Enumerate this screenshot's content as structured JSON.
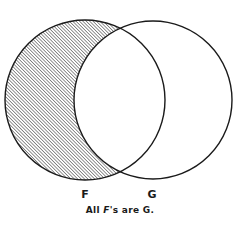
{
  "diagram": {
    "type": "venn",
    "sets": [
      {
        "label": "F",
        "shaded_region": "F minus G"
      },
      {
        "label": "G"
      }
    ],
    "caption": {
      "italic_part": "F",
      "prefix": "All ",
      "suffix": "'s are G."
    },
    "colors": {
      "stroke": "#1a1a1a",
      "hatch": "#2a2a2a",
      "background": "#ffffff"
    }
  }
}
